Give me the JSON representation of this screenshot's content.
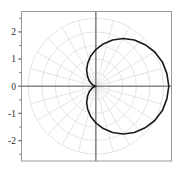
{
  "figure": {
    "title": "",
    "background_color": "#ffffff",
    "frame_color": "#999999",
    "axis_color": "#888888",
    "grid_color": "#dddddd",
    "curve_color": "#1a1a1a"
  },
  "axes": {
    "y_tick_labels": [
      "2",
      "1",
      "0",
      "-1",
      "-2"
    ],
    "y_tick_values": [
      2,
      1,
      0,
      -1,
      -2
    ],
    "y_minor_tick_values": [
      2.5,
      1.5,
      0.5,
      -0.5,
      -1.5,
      -2.5
    ],
    "x_tick_labels": [],
    "xlim": [
      -2.75,
      2.8
    ],
    "ylim": [
      -2.75,
      2.75
    ],
    "xlabel": "",
    "ylabel": "",
    "grid": true
  },
  "chart_data": {
    "type": "line",
    "plot_style": "polar-cardioid",
    "title": "",
    "xlabel": "",
    "ylabel": "",
    "xlim": [
      -2.75,
      2.8
    ],
    "ylim": [
      -2.75,
      2.75
    ],
    "grid": true,
    "legend": null,
    "polar_grid": {
      "radii": [
        0.5,
        1.0,
        1.5,
        2.0,
        2.5
      ],
      "angle_spokes_deg": [
        0,
        15,
        30,
        45,
        60,
        75,
        90,
        105,
        120,
        135,
        150,
        165,
        180,
        195,
        210,
        225,
        240,
        255,
        270,
        285,
        300,
        315,
        330,
        345
      ]
    },
    "series": [
      {
        "name": "r = 1.35(1 + cos(theta))",
        "equation": "r = 1.35 (1 + cos θ)",
        "r_max": 2.7,
        "r_min": 0,
        "cusp_at": [
          0,
          0
        ],
        "max_x": 2.7,
        "max_y": 1.31,
        "min_y": -1.31,
        "theta": [
          0,
          10,
          20,
          30,
          40,
          50,
          60,
          70,
          80,
          90,
          100,
          110,
          120,
          130,
          140,
          150,
          160,
          170,
          180,
          190,
          200,
          210,
          220,
          230,
          240,
          250,
          260,
          270,
          280,
          290,
          300,
          310,
          320,
          330,
          340,
          350,
          360
        ],
        "r": [
          2.7,
          2.67,
          2.62,
          2.52,
          2.38,
          2.22,
          2.03,
          1.81,
          1.58,
          1.35,
          1.12,
          0.89,
          0.68,
          0.48,
          0.32,
          0.18,
          0.08,
          0.02,
          0.0,
          0.02,
          0.08,
          0.18,
          0.32,
          0.48,
          0.68,
          0.89,
          1.12,
          1.35,
          1.58,
          1.81,
          2.03,
          2.22,
          2.38,
          2.52,
          2.62,
          2.67,
          2.7
        ]
      }
    ]
  }
}
